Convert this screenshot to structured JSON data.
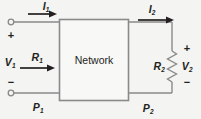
{
  "figure": {
    "type": "two-port-network-circuit-diagram",
    "background_color": "#f4f4f2",
    "line_color": "#8a8a8a",
    "text_color": "#231f20",
    "width": 201,
    "height": 119
  },
  "network_box": {
    "label": "Network",
    "x": 59,
    "y": 19,
    "width": 69,
    "height": 81,
    "fill": "#f8f8f7",
    "stroke": "#8a8a8a"
  },
  "input_port": {
    "voltage_label": "V",
    "voltage_sub": "1",
    "current_label": "I",
    "current_sub": "1",
    "resistance_label": "R",
    "resistance_sub": "1",
    "power_label": "P",
    "power_sub": "1",
    "polarity_plus": "+",
    "polarity_minus": "−",
    "terminal_top": "input-terminal-top",
    "terminal_bottom": "input-terminal-bottom"
  },
  "output_port": {
    "voltage_label": "V",
    "voltage_sub": "2",
    "current_label": "I",
    "current_sub": "2",
    "resistance_label": "R",
    "resistance_sub": "2",
    "power_label": "P",
    "power_sub": "2",
    "polarity_plus": "+",
    "polarity_minus": "−",
    "load_element": "resistor-zigzag"
  },
  "arrows": [
    {
      "name": "current-arrow-i1",
      "x1": 28,
      "y1": 14,
      "x2": 57,
      "y2": 14
    },
    {
      "name": "resistance-arrow-r1",
      "x1": 20,
      "y1": 68,
      "x2": 55,
      "y2": 68
    },
    {
      "name": "current-arrow-i2",
      "x1": 138,
      "y1": 20,
      "x2": 174,
      "y2": 20
    }
  ]
}
